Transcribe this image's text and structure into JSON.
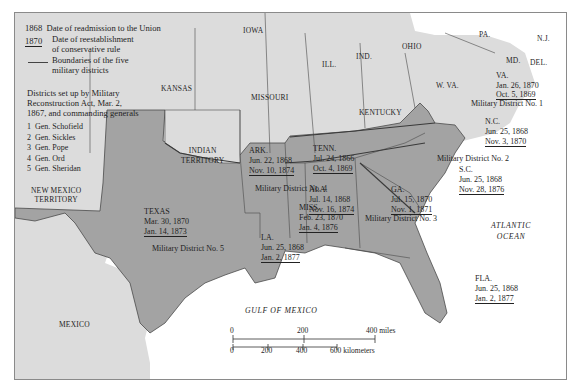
{
  "legend": {
    "readmission_sample": "1868",
    "readmission_text": "Date of readmission to the Union",
    "conservative_sample": "1870",
    "conservative_text_1": "Date of reestablishment",
    "conservative_text_2": "of conservative rule",
    "boundary_text_1": "Boundaries of the five",
    "boundary_text_2": "military districts",
    "districts_heading_1": "Districts set up by Military",
    "districts_heading_2": "Reconstruction Act, Mar. 2,",
    "districts_heading_3": "1867, and commanding generals",
    "generals": [
      {
        "num": "1",
        "name": "Gen. Schofield"
      },
      {
        "num": "2",
        "name": "Gen. Sickles"
      },
      {
        "num": "3",
        "name": "Gen. Pope"
      },
      {
        "num": "4",
        "name": "Gen. Ord"
      },
      {
        "num": "5",
        "name": "Gen. Sheridan"
      }
    ]
  },
  "regions": {
    "iowa": "IOWA",
    "ill": "ILL.",
    "ind": "IND.",
    "ohio": "OHIO",
    "pa": "PA.",
    "nj": "N.J.",
    "md": "MD.",
    "del": "DEL.",
    "wva": "W. VA.",
    "kansas": "KANSAS",
    "missouri": "MISSOURI",
    "kentucky": "KENTUCKY",
    "indian_territory_1": "INDIAN",
    "indian_territory_2": "TERRITORY",
    "new_mexico_1": "NEW MEXICO",
    "new_mexico_2": "TERRITORY",
    "mexico": "MEXICO",
    "gulf": "GULF OF MEXICO",
    "atlantic_1": "ATLANTIC",
    "atlantic_2": "OCEAN"
  },
  "states": {
    "va": {
      "name": "VA.",
      "readmitted": "Jan. 26, 1870",
      "conservative": "Oct. 5, 1869"
    },
    "nc": {
      "name": "N.C.",
      "readmitted": "Jun. 25, 1868",
      "conservative": "Nov. 3, 1870"
    },
    "sc": {
      "name": "S.C.",
      "readmitted": "Jun. 25, 1868",
      "conservative": "Nov. 28, 1876"
    },
    "ga": {
      "name": "GA.",
      "readmitted": "Jul. 15, 1870",
      "conservative": "Nov. 1, 1871"
    },
    "fla": {
      "name": "FLA.",
      "readmitted": "Jun. 25, 1868",
      "conservative": "Jan. 2, 1877"
    },
    "ala": {
      "name": "ALA.",
      "readmitted": "Jul. 14, 1868",
      "conservative": "Nov. 16, 1874"
    },
    "tenn": {
      "name": "TENN.",
      "readmitted": "Jul. 24, 1866",
      "conservative": "Oct. 4, 1869"
    },
    "ark": {
      "name": "ARK.",
      "readmitted": "Jun. 22, 1868",
      "conservative": "Nov. 10, 1874"
    },
    "miss": {
      "name": "MISS.",
      "readmitted": "Feb. 23, 1870",
      "conservative": "Jan. 4, 1876"
    },
    "la": {
      "name": "LA.",
      "readmitted": "Jun. 25, 1868",
      "conservative": "Jan. 2, 1877"
    },
    "texas": {
      "name": "TEXAS",
      "readmitted": "Mar. 30, 1870",
      "conservative": "Jan. 14, 1873"
    }
  },
  "districts": {
    "d1": "Military District No. 1",
    "d2": "Military District No. 2",
    "d3": "Military District No. 3",
    "d4": "Military District No. 4",
    "d5": "Military District No. 5"
  },
  "scale": {
    "miles": [
      "0",
      "200",
      "400 miles"
    ],
    "km": [
      "0",
      "200",
      "400",
      "600 kilometers"
    ]
  },
  "colors": {
    "union_fill": "#d9d9d9",
    "confederate_fill": "#a3a3a3",
    "water": "#ffffff",
    "border": "#4a4a4a"
  }
}
